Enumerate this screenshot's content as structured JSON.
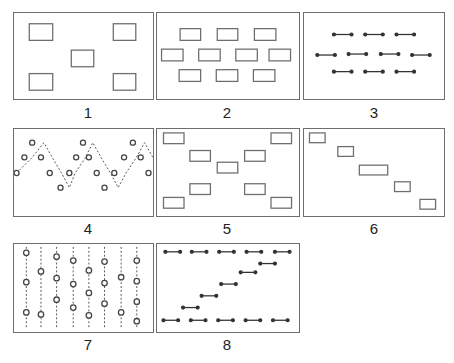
{
  "figure": {
    "panels": [
      {
        "label": "1",
        "pattern": "five rectangles: four corners and one center"
      },
      {
        "label": "2",
        "pattern": "ten rectangles in rows of 3, 4, 3"
      },
      {
        "label": "3",
        "pattern": "ten dumbbell segments in rows of 3, 4, 3"
      },
      {
        "label": "4",
        "pattern": "circles connected by dashed zigzag line"
      },
      {
        "label": "5",
        "pattern": "nine rectangles in X arrangement"
      },
      {
        "label": "6",
        "pattern": "five rectangles in descending diagonal"
      },
      {
        "label": "7",
        "pattern": "circles on eight vertical dashed lines"
      },
      {
        "label": "8",
        "pattern": "dumbbell segments: top row, ascending diagonal, bottom row"
      }
    ]
  },
  "colors": {
    "stroke": "#6e6e6e",
    "dark": "#333333",
    "background": "#ffffff"
  }
}
